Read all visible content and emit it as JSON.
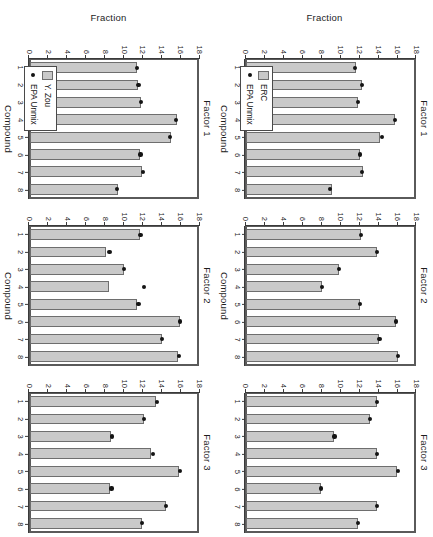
{
  "figure": {
    "axis": {
      "ylabel": "Fraction",
      "xlabel": "Compound",
      "yticks": [
        0,
        2,
        4,
        6,
        8,
        10,
        12,
        14,
        16,
        18
      ],
      "ylim": [
        0,
        18
      ],
      "xticks": [
        1,
        2,
        3,
        4,
        5,
        6,
        7,
        8
      ]
    },
    "colors": {
      "bar_fill": "#c9c9c9",
      "bar_border": "#6e6e6e",
      "point": "#141414",
      "axis": "#3a3a3a",
      "frame": "#5a5a5a",
      "background": "#ffffff"
    },
    "legend_entries": {
      "bar_icon": "legend-bar-swatch",
      "point_icon": "legend-point-swatch",
      "epa_label": "EPA Unmix",
      "erc_label": "ERC",
      "yzou_label": "Y. Zou"
    }
  },
  "chart_data": [
    {
      "id": "row1-factor1",
      "type": "bar",
      "title": "Factor 1",
      "xlabel": "Compound",
      "ylabel": "Fraction",
      "ylim": [
        0,
        18
      ],
      "grid": false,
      "legend_position": "bottom-left",
      "categories": [
        "1",
        "2",
        "3",
        "4",
        "5",
        "6",
        "7",
        "8"
      ],
      "series": [
        {
          "name": "ERC",
          "kind": "bar",
          "values": [
            11.7,
            12.3,
            11.9,
            15.9,
            14.3,
            12.1,
            12.5,
            9.1
          ]
        },
        {
          "name": "EPA Unmix",
          "kind": "point",
          "values": [
            11.6,
            12.3,
            11.9,
            15.9,
            14.5,
            12.1,
            12.3,
            8.9
          ]
        }
      ]
    },
    {
      "id": "row1-factor2",
      "type": "bar",
      "title": "Factor 2",
      "xlabel": "Compound",
      "ylabel": "Fraction",
      "ylim": [
        0,
        18
      ],
      "grid": false,
      "legend_position": "none",
      "categories": [
        "1",
        "2",
        "3",
        "4",
        "5",
        "6",
        "7",
        "8"
      ],
      "series": [
        {
          "name": "ERC",
          "kind": "bar",
          "values": [
            12.2,
            13.9,
            9.9,
            8.1,
            12.1,
            16.0,
            14.2,
            16.2
          ]
        },
        {
          "name": "EPA Unmix",
          "kind": "point",
          "values": [
            12.2,
            13.9,
            9.9,
            8.1,
            12.1,
            16.0,
            14.2,
            16.2
          ]
        }
      ]
    },
    {
      "id": "row1-factor3",
      "type": "bar",
      "title": "Factor 3",
      "xlabel": "Compound",
      "ylabel": "Fraction",
      "ylim": [
        0,
        18
      ],
      "grid": false,
      "legend_position": "none",
      "categories": [
        "1",
        "2",
        "3",
        "4",
        "5",
        "6",
        "7",
        "8"
      ],
      "series": [
        {
          "name": "ERC",
          "kind": "bar",
          "values": [
            13.9,
            13.2,
            9.4,
            13.9,
            16.1,
            8.0,
            13.9,
            11.9
          ]
        },
        {
          "name": "EPA Unmix",
          "kind": "point",
          "values": [
            13.9,
            13.2,
            9.4,
            13.9,
            16.2,
            8.0,
            13.9,
            11.9
          ]
        }
      ]
    },
    {
      "id": "row2-factor1",
      "type": "bar",
      "title": "Factor 1",
      "xlabel": "Compound",
      "ylabel": "Fraction",
      "ylim": [
        0,
        18
      ],
      "grid": false,
      "legend_position": "bottom-left",
      "categories": [
        "1",
        "2",
        "3",
        "4",
        "5",
        "6",
        "7",
        "8"
      ],
      "series": [
        {
          "name": "Y. Zou",
          "kind": "bar",
          "values": [
            11.4,
            11.5,
            11.9,
            15.7,
            15.1,
            11.8,
            12.0,
            9.4
          ]
        },
        {
          "name": "EPA Unmix",
          "kind": "point",
          "values": [
            11.4,
            11.6,
            11.9,
            15.6,
            15.0,
            11.8,
            12.1,
            9.3
          ]
        }
      ]
    },
    {
      "id": "row2-factor2",
      "type": "bar",
      "title": "Factor 2",
      "xlabel": "Compound",
      "ylabel": "Fraction",
      "ylim": [
        0,
        18
      ],
      "grid": false,
      "legend_position": "none",
      "categories": [
        "1",
        "2",
        "3",
        "4",
        "5",
        "6",
        "7",
        "8"
      ],
      "series": [
        {
          "name": "Y. Zou",
          "kind": "bar",
          "values": [
            11.8,
            8.1,
            10.0,
            8.4,
            11.4,
            16.0,
            14.1,
            15.8
          ]
        },
        {
          "name": "EPA Unmix",
          "kind": "point",
          "values": [
            11.8,
            8.5,
            10.0,
            12.2,
            11.6,
            16.0,
            14.1,
            15.9
          ]
        }
      ]
    },
    {
      "id": "row2-factor3",
      "type": "bar",
      "title": "Factor 3",
      "xlabel": "Compound",
      "ylabel": "Fraction",
      "ylim": [
        0,
        18
      ],
      "grid": false,
      "legend_position": "none",
      "categories": [
        "1",
        "2",
        "3",
        "4",
        "5",
        "6",
        "7",
        "8"
      ],
      "series": [
        {
          "name": "Y. Zou",
          "kind": "bar",
          "values": [
            13.5,
            12.2,
            8.7,
            12.9,
            15.9,
            8.6,
            14.5,
            12.0
          ]
        },
        {
          "name": "EPA Unmix",
          "kind": "point",
          "values": [
            13.6,
            12.2,
            8.8,
            13.1,
            16.0,
            8.7,
            14.5,
            12.0
          ]
        }
      ]
    }
  ]
}
